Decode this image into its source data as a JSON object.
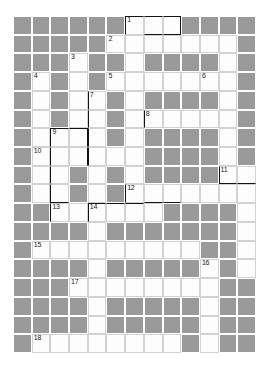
{
  "puzzle": {
    "kind": "crossword-grid",
    "columns": 13,
    "rows": 18,
    "colors": {
      "block": "#9a9a9a",
      "open": "#fdfdfd",
      "page": "#ffffff",
      "cell_border": "#d2d2d2",
      "emphasis_border": "#121212",
      "number_text": "#1b1b1b"
    },
    "legend": {
      "block_label": "blocked cell",
      "open_label": "fillable cell"
    },
    "clue_numbers": [
      {
        "n": "1",
        "row": 0,
        "col": 6
      },
      {
        "n": "2",
        "row": 1,
        "col": 5
      },
      {
        "n": "3",
        "row": 2,
        "col": 3
      },
      {
        "n": "4",
        "row": 3,
        "col": 1
      },
      {
        "n": "5",
        "row": 3,
        "col": 5
      },
      {
        "n": "6",
        "row": 3,
        "col": 10
      },
      {
        "n": "7",
        "row": 4,
        "col": 4
      },
      {
        "n": "8",
        "row": 5,
        "col": 7
      },
      {
        "n": "9",
        "row": 6,
        "col": 2
      },
      {
        "n": "10",
        "row": 7,
        "col": 1
      },
      {
        "n": "11",
        "row": 8,
        "col": 11
      },
      {
        "n": "12",
        "row": 9,
        "col": 6
      },
      {
        "n": "13",
        "row": 10,
        "col": 2
      },
      {
        "n": "14",
        "row": 10,
        "col": 4
      },
      {
        "n": "15",
        "row": 12,
        "col": 1
      },
      {
        "n": "16",
        "row": 13,
        "col": 10
      },
      {
        "n": "17",
        "row": 14,
        "col": 3
      },
      {
        "n": "18",
        "row": 17,
        "col": 1
      }
    ],
    "open_cells": [
      [
        0,
        6
      ],
      [
        0,
        7
      ],
      [
        0,
        8
      ],
      [
        1,
        5
      ],
      [
        1,
        6
      ],
      [
        1,
        7
      ],
      [
        1,
        8
      ],
      [
        1,
        9
      ],
      [
        1,
        10
      ],
      [
        1,
        11
      ],
      [
        2,
        3
      ],
      [
        2,
        6
      ],
      [
        2,
        11
      ],
      [
        3,
        1
      ],
      [
        3,
        3
      ],
      [
        3,
        5
      ],
      [
        3,
        6
      ],
      [
        3,
        7
      ],
      [
        3,
        8
      ],
      [
        3,
        9
      ],
      [
        3,
        10
      ],
      [
        3,
        11
      ],
      [
        4,
        1
      ],
      [
        4,
        3
      ],
      [
        4,
        4
      ],
      [
        4,
        6
      ],
      [
        4,
        11
      ],
      [
        5,
        1
      ],
      [
        5,
        3
      ],
      [
        5,
        4
      ],
      [
        5,
        6
      ],
      [
        5,
        7
      ],
      [
        5,
        8
      ],
      [
        5,
        9
      ],
      [
        5,
        10
      ],
      [
        5,
        11
      ],
      [
        6,
        1
      ],
      [
        6,
        2
      ],
      [
        6,
        3
      ],
      [
        6,
        4
      ],
      [
        6,
        6
      ],
      [
        6,
        11
      ],
      [
        7,
        1
      ],
      [
        7,
        2
      ],
      [
        7,
        3
      ],
      [
        7,
        4
      ],
      [
        7,
        5
      ],
      [
        7,
        6
      ],
      [
        7,
        11
      ],
      [
        8,
        1
      ],
      [
        8,
        2
      ],
      [
        8,
        4
      ],
      [
        8,
        6
      ],
      [
        8,
        11
      ],
      [
        8,
        12
      ],
      [
        9,
        1
      ],
      [
        9,
        2
      ],
      [
        9,
        4
      ],
      [
        9,
        6
      ],
      [
        9,
        7
      ],
      [
        9,
        8
      ],
      [
        9,
        9
      ],
      [
        9,
        10
      ],
      [
        9,
        11
      ],
      [
        9,
        12
      ],
      [
        10,
        2
      ],
      [
        10,
        3
      ],
      [
        10,
        4
      ],
      [
        10,
        5
      ],
      [
        10,
        6
      ],
      [
        10,
        7
      ],
      [
        10,
        12
      ],
      [
        11,
        4
      ],
      [
        11,
        12
      ],
      [
        12,
        1
      ],
      [
        12,
        2
      ],
      [
        12,
        3
      ],
      [
        12,
        4
      ],
      [
        12,
        5
      ],
      [
        12,
        6
      ],
      [
        12,
        7
      ],
      [
        12,
        8
      ],
      [
        12,
        9
      ],
      [
        12,
        12
      ],
      [
        13,
        4
      ],
      [
        13,
        10
      ],
      [
        13,
        12
      ],
      [
        14,
        3
      ],
      [
        14,
        4
      ],
      [
        14,
        5
      ],
      [
        14,
        6
      ],
      [
        14,
        7
      ],
      [
        14,
        8
      ],
      [
        14,
        9
      ],
      [
        14,
        10
      ],
      [
        15,
        4
      ],
      [
        15,
        10
      ],
      [
        16,
        4
      ],
      [
        16,
        10
      ],
      [
        17,
        1
      ],
      [
        17,
        2
      ],
      [
        17,
        3
      ],
      [
        17,
        4
      ],
      [
        17,
        5
      ],
      [
        17,
        6
      ],
      [
        17,
        7
      ],
      [
        17,
        8
      ],
      [
        17,
        10
      ]
    ],
    "emphasis_edges": [
      {
        "row": 0,
        "col": 6,
        "sides": [
          "bt",
          "bl"
        ]
      },
      {
        "row": 0,
        "col": 7,
        "sides": [
          "bt",
          "bb"
        ]
      },
      {
        "row": 0,
        "col": 8,
        "sides": [
          "bt",
          "bb",
          "br"
        ]
      },
      {
        "row": 4,
        "col": 4,
        "sides": [
          "bl"
        ]
      },
      {
        "row": 5,
        "col": 4,
        "sides": [
          "bl"
        ]
      },
      {
        "row": 5,
        "col": 7,
        "sides": [
          "bl"
        ]
      },
      {
        "row": 6,
        "col": 2,
        "sides": [
          "bt",
          "bl"
        ]
      },
      {
        "row": 6,
        "col": 3,
        "sides": [
          "bt",
          "br"
        ]
      },
      {
        "row": 6,
        "col": 4,
        "sides": [
          "bl"
        ]
      },
      {
        "row": 7,
        "col": 2,
        "sides": [
          "bl"
        ]
      },
      {
        "row": 7,
        "col": 3,
        "sides": [
          "br"
        ]
      },
      {
        "row": 7,
        "col": 4,
        "sides": [
          "bl"
        ]
      },
      {
        "row": 8,
        "col": 2,
        "sides": [
          "bl"
        ]
      },
      {
        "row": 8,
        "col": 11,
        "sides": [
          "bb",
          "bl"
        ]
      },
      {
        "row": 8,
        "col": 12,
        "sides": [
          "bb"
        ]
      },
      {
        "row": 9,
        "col": 2,
        "sides": [
          "bl",
          "bb"
        ]
      },
      {
        "row": 9,
        "col": 6,
        "sides": [
          "bl"
        ]
      },
      {
        "row": 9,
        "col": 7,
        "sides": [
          "bb"
        ]
      },
      {
        "row": 9,
        "col": 8,
        "sides": [
          "bb"
        ]
      },
      {
        "row": 10,
        "col": 2,
        "sides": [
          "bl"
        ]
      },
      {
        "row": 10,
        "col": 4,
        "sides": [
          "bt",
          "bl"
        ]
      },
      {
        "row": 10,
        "col": 5,
        "sides": [
          "bt"
        ]
      },
      {
        "row": 10,
        "col": 6,
        "sides": [
          "bt"
        ]
      }
    ]
  }
}
